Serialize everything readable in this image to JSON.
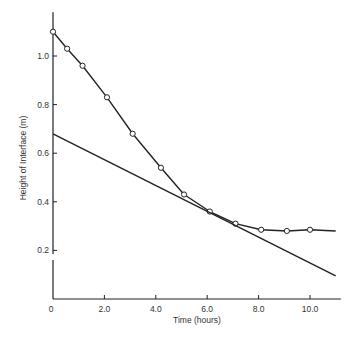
{
  "chart_data": {
    "type": "line",
    "title": "",
    "xlabel": "Time (hours)",
    "ylabel": "Height of Interface (m)",
    "xlim": [
      0,
      11.2
    ],
    "ylim": [
      0,
      1.18
    ],
    "grid": false,
    "legend": null,
    "x_ticks": [
      {
        "value": 0,
        "label": "0"
      },
      {
        "value": 2.0,
        "label": "2.0"
      },
      {
        "value": 4.0,
        "label": "4.0"
      },
      {
        "value": 6.0,
        "label": "6.0"
      },
      {
        "value": 8.0,
        "label": "8.0"
      },
      {
        "value": 10.0,
        "label": "10.0"
      }
    ],
    "y_ticks": [
      {
        "value": 0.2,
        "label": "0.2"
      },
      {
        "value": 0.4,
        "label": "0.4"
      },
      {
        "value": 0.6,
        "label": "0.6"
      },
      {
        "value": 0.8,
        "label": "0.8"
      },
      {
        "value": 1.0,
        "label": "1.0"
      }
    ],
    "series": [
      {
        "name": "Interface height (measured)",
        "marker": "open-circle",
        "color": "#222222",
        "x": [
          0,
          0.55,
          1.15,
          2.1,
          3.1,
          4.2,
          5.1,
          6.1,
          7.1,
          8.1,
          9.1,
          10.0
        ],
        "y": [
          1.1,
          1.03,
          0.96,
          0.83,
          0.68,
          0.54,
          0.43,
          0.36,
          0.31,
          0.285,
          0.28,
          0.285
        ],
        "line_extends_to": {
          "x": 11.0,
          "y": 0.28
        }
      },
      {
        "name": "Tangent line",
        "marker": "none",
        "color": "#222222",
        "x": [
          0,
          11.0
        ],
        "y": [
          0.68,
          0.095
        ]
      }
    ]
  }
}
